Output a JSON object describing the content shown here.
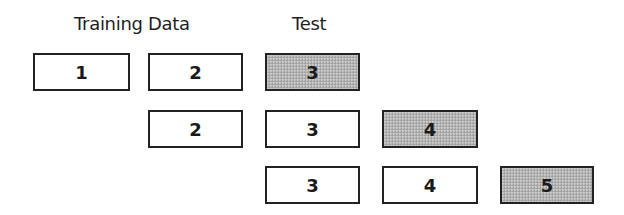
{
  "headers": {
    "training": "Training Data",
    "test": "Test"
  },
  "colors": {
    "border": "#222222",
    "train_fill": "#ffffff",
    "test_fill": "#b3b3b3"
  },
  "rows": [
    {
      "folds": [
        {
          "label": "1",
          "role": "train"
        },
        {
          "label": "2",
          "role": "train"
        },
        {
          "label": "3",
          "role": "test"
        }
      ]
    },
    {
      "folds": [
        {
          "label": "2",
          "role": "train"
        },
        {
          "label": "3",
          "role": "train"
        },
        {
          "label": "4",
          "role": "test"
        }
      ]
    },
    {
      "folds": [
        {
          "label": "3",
          "role": "train"
        },
        {
          "label": "4",
          "role": "train"
        },
        {
          "label": "5",
          "role": "test"
        }
      ]
    }
  ]
}
